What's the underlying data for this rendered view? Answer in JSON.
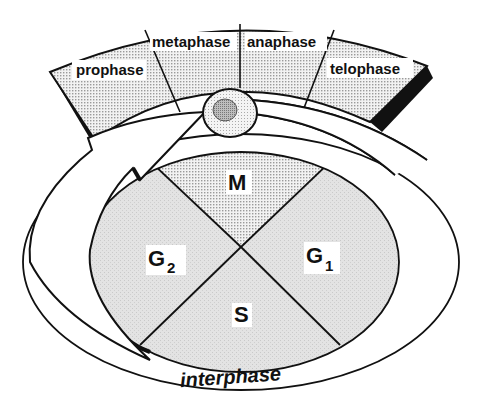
{
  "diagram": {
    "mitosis_phases": [
      {
        "label": "prophase"
      },
      {
        "label": "metaphase"
      },
      {
        "label": "anaphase"
      },
      {
        "label": "telophase"
      }
    ],
    "cycle_phases": {
      "M": {
        "label": "M"
      },
      "G1": {
        "label": "G",
        "subscript": "1"
      },
      "S": {
        "label": "S"
      },
      "G2": {
        "label": "G",
        "subscript": "2"
      }
    },
    "outer_label": "interphase",
    "icons": [
      "cell-icon",
      "cycle-arrow-icon"
    ],
    "colors": {
      "ink": "#111111",
      "dot_fill": "#e4e4e4",
      "interphase_fill": "#e1e1e1",
      "background": "#ffffff"
    }
  }
}
